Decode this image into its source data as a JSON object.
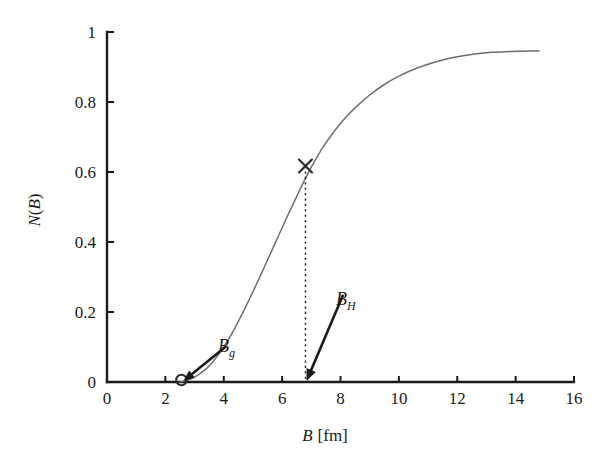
{
  "chart_data": {
    "type": "line",
    "title": "",
    "xlabel": "B [fm]",
    "xlabel_symbol": "B",
    "xlabel_unit": "[fm]",
    "ylabel": "N(B)",
    "ylabel_symbol_n": "N",
    "ylabel_open": "(",
    "ylabel_symbol_b": "B",
    "ylabel_close": ")",
    "xlim": [
      0,
      16
    ],
    "ylim": [
      0,
      1
    ],
    "grid": false,
    "legend": "none",
    "xticks": [
      0,
      2,
      4,
      6,
      8,
      10,
      12,
      14,
      16
    ],
    "xtick_labels": [
      "0",
      "2",
      "4",
      "6",
      "8",
      "10",
      "12",
      "14",
      "16"
    ],
    "yticks": [
      0,
      0.2,
      0.4,
      0.6,
      0.8,
      1
    ],
    "ytick_labels": [
      "0",
      "0.2",
      "0.4",
      "0.6",
      "0.8",
      "1"
    ],
    "series": [
      {
        "name": "N(B)",
        "color": "#6e6e6e",
        "x": [
          2.5,
          2.7,
          2.9,
          3.1,
          3.3,
          3.5,
          3.8,
          4.1,
          4.4,
          4.7,
          5.0,
          5.4,
          5.8,
          6.2,
          6.6,
          6.8,
          7.0,
          7.4,
          7.8,
          8.2,
          8.6,
          9.0,
          9.5,
          10.0,
          10.5,
          11.0,
          11.5,
          12.0,
          12.6,
          13.2,
          13.8,
          14.3,
          14.8
        ],
        "y": [
          0.0,
          0.004,
          0.01,
          0.019,
          0.031,
          0.046,
          0.076,
          0.113,
          0.157,
          0.206,
          0.258,
          0.33,
          0.404,
          0.477,
          0.548,
          0.582,
          0.614,
          0.671,
          0.718,
          0.758,
          0.791,
          0.82,
          0.85,
          0.874,
          0.893,
          0.908,
          0.92,
          0.929,
          0.937,
          0.942,
          0.944,
          0.945,
          0.946
        ]
      }
    ],
    "markers": [
      {
        "name": "cross-marker",
        "glyph": "x",
        "x": 6.8,
        "y": 0.617,
        "label": ""
      },
      {
        "name": "circle-marker",
        "glyph": "o",
        "x": 2.55,
        "y": 0.0,
        "label": ""
      }
    ],
    "annotations": [
      {
        "name": "bg-annotation",
        "symbol": "B",
        "subscript": "g",
        "text": "B_g",
        "label_x": 4.25,
        "label_y": 0.105,
        "point_x": 2.55,
        "point_y": 0.0
      },
      {
        "name": "bh-annotation",
        "symbol": "B",
        "subscript": "H",
        "text": "B_H",
        "label_x": 8.35,
        "label_y": 0.255,
        "point_x": 6.8,
        "point_y": 0.0
      }
    ],
    "guide_lines": [
      {
        "name": "dropline-to-axis",
        "style": "dotted",
        "x": 6.8,
        "y_from": 0.617,
        "y_to": 0.0
      }
    ],
    "colors": {
      "axis": "#1a1a1a",
      "curve": "#6e6e6e",
      "annotation": "#1a1a1a",
      "background": "#ffffff"
    }
  }
}
